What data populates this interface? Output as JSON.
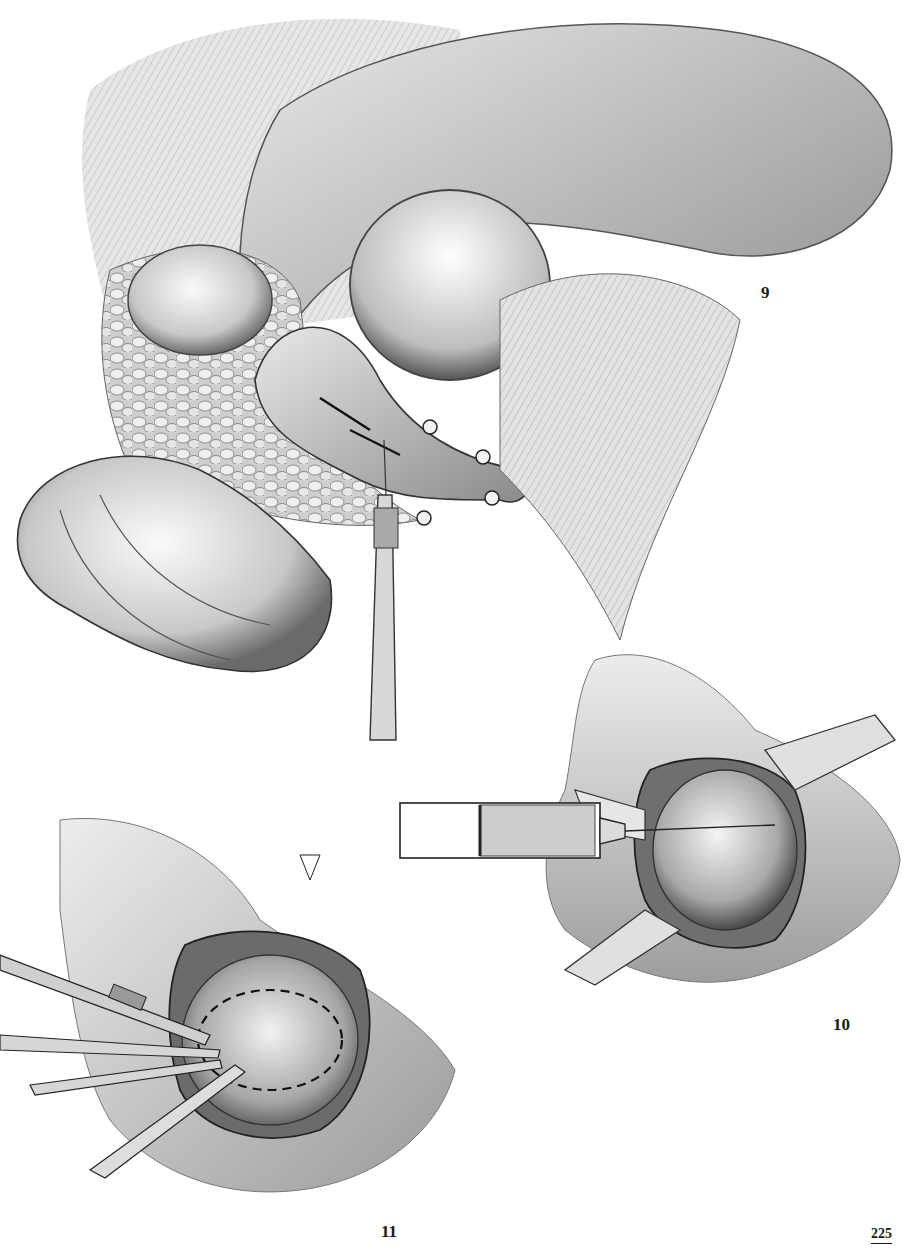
{
  "page": {
    "number": "225",
    "background": "#ffffff"
  },
  "figures": [
    {
      "id": "figure-9",
      "label": "9",
      "description": "Surgical illustration: exposure of bladder with stay sutures and needle holder incision"
    },
    {
      "id": "figure-10",
      "label": "10",
      "description": "Surgical illustration: syringe injecting into exposed bladder held by retractors"
    },
    {
      "id": "figure-11",
      "label": "11",
      "description": "Surgical illustration: dissection with scalpel and forceps along dashed incision line"
    }
  ],
  "colors": {
    "ink": "#1a1a1a",
    "shade_dark": "#6e6e6e",
    "shade_mid": "#a8a8a8",
    "shade_light": "#d9d9d9"
  }
}
